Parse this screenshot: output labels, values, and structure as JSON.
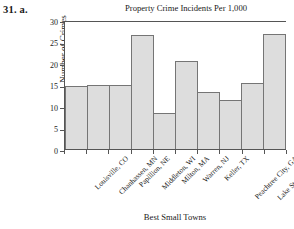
{
  "problem": {
    "label": "31.  a."
  },
  "chart_data": {
    "type": "bar",
    "title": "Property Crime Incidents Per 1,000",
    "xlabel": "Best Small Towns",
    "ylabel": "Number of Crimes",
    "ylim": [
      0,
      30
    ],
    "ytick_labels": [
      "0",
      "5",
      "10",
      "15",
      "20",
      "25",
      "30"
    ],
    "ytick_values": [
      0,
      5,
      10,
      15,
      20,
      25,
      30
    ],
    "grid": false,
    "legend": "none",
    "bar_fill_color": "#dddddd",
    "bar_edge_color": "#757575",
    "axis_color": "#555555",
    "categories": [
      "Louisville, CO",
      "Chanhassen, MN",
      "Papillion, NE",
      "Middleton, WI",
      "Milton, MA",
      "Warren, NJ",
      "Keller, TX",
      "Peachtree City, GA",
      "Lake St. Louis, MO",
      "Mukilteo, WA"
    ],
    "values": [
      14.6,
      15.0,
      15.0,
      26.4,
      8.3,
      20.4,
      13.3,
      11.5,
      15.4,
      26.7
    ]
  }
}
